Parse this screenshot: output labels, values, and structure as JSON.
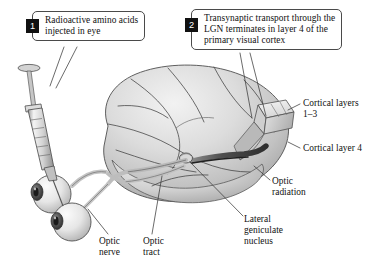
{
  "figure": {
    "background_color": "#ffffff",
    "ink_color": "#111111"
  },
  "callouts": [
    {
      "number": "1",
      "text": "Radioactive amino acids injected in eye",
      "name": "callout-radioactive-injection"
    },
    {
      "number": "2",
      "text": "Transynaptic transport through the LGN terminates in layer 4 of the primary visual cortex",
      "name": "callout-transynaptic-transport"
    }
  ],
  "labels": {
    "cortical_layers_1_3": "Cortical layers\n1–3",
    "cortical_layer_4": "Cortical layer 4",
    "optic_radiation": "Optic\nradiation",
    "lateral_geniculate_nucleus": "Lateral\ngeniculate\nnucleus",
    "optic_nerve": "Optic\nnerve",
    "optic_tract": "Optic\ntract"
  },
  "anatomy": {
    "brain": "cerebral-hemisphere-lateral-view",
    "eyes": [
      "left-eyeball",
      "right-eyeball"
    ],
    "syringe": "hypodermic-syringe",
    "cutaway": "occipital-cortex-cutaway-block",
    "pathway": "optic-nerve-chiasm-tract-lgn-optic-radiation"
  },
  "palette": {
    "brain_light": "#e8e8e8",
    "brain_mid": "#c9c9c9",
    "brain_shadow": "#9a9a9a",
    "tract_gray": "#b5b5b5",
    "tract_dark": "#6d6d6d",
    "outline": "#4a4a4a",
    "badge_bg": "#111111",
    "badge_fg": "#ffffff"
  }
}
